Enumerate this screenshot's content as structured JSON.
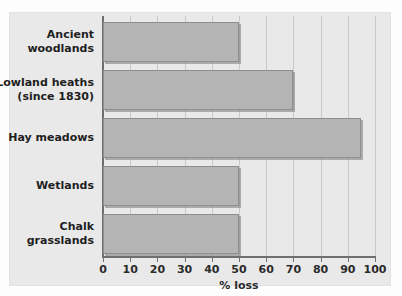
{
  "chart_data": {
    "type": "bar",
    "orientation": "horizontal",
    "title": "",
    "xlabel": "% loss",
    "ylabel": "",
    "xlim": [
      0,
      100
    ],
    "ylim": null,
    "grid": "vertical",
    "legend": "none",
    "categories": [
      "Ancient woodlands",
      "Lowland heaths (since 1830)",
      "Hay meadows",
      "Wetlands",
      "Chalk grasslands"
    ],
    "category_lines": [
      [
        "Ancient",
        "woodlands"
      ],
      [
        "Lowland heaths",
        "(since 1830)"
      ],
      [
        "Hay meadows"
      ],
      [
        "Wetlands"
      ],
      [
        "Chalk",
        "grasslands"
      ]
    ],
    "values": [
      50,
      70,
      95,
      50,
      50
    ],
    "xticks": [
      0,
      10,
      20,
      30,
      40,
      50,
      60,
      70,
      80,
      90,
      100
    ],
    "xticklabels": [
      "0",
      "10",
      "20",
      "30",
      "40",
      "50",
      "60",
      "70",
      "80",
      "90",
      "100"
    ],
    "colors": {
      "bar_fill": "#b4b4b4",
      "bar_edge": "#8e8e8e",
      "panel_background": "#e9e9e9",
      "figure_background": "#fdfdfd",
      "gridline": "#c9c9c9",
      "axis": "#6f6f6f",
      "text": "#1f1f1f"
    }
  }
}
